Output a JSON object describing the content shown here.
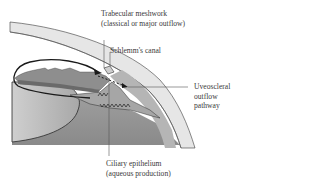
{
  "diagram": {
    "labels": {
      "trabecular": {
        "line1": "Trabecular meshwork",
        "line2": "(classical or major outflow)"
      },
      "schlemm": {
        "line1": "Schlemm's canal"
      },
      "uveoscleral": {
        "line1": "Uveoscleral",
        "line2": "outflow",
        "line3": "pathway"
      },
      "ciliary": {
        "line1": "Ciliary epithelium",
        "line2": "(aqueous production)"
      }
    },
    "colors": {
      "background": "#ffffff",
      "cornea_sclera": "#e4e4e4",
      "iris": "#8e8e8e",
      "ciliary_body": "#a0a0a0",
      "lens": "#b8b8b8",
      "vitreous": "#9a9a9a",
      "outline": "#2a2a2a",
      "leader_line": "#555555"
    }
  }
}
